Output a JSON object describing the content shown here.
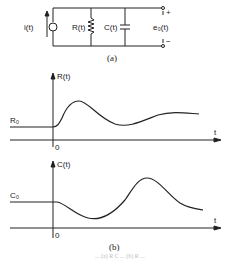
{
  "circuit": {
    "source_label": "i(t)",
    "resistor_label": "R(t)",
    "capacitor_label": "C(t)",
    "output_label": "e₀(t)",
    "plus": "+",
    "minus": "−",
    "caption": "(a)"
  },
  "plots": {
    "top": {
      "y_label": "R(t)",
      "x_label": "t",
      "origin": "0",
      "initial_level": "R₀"
    },
    "bottom": {
      "y_label": "C(t)",
      "x_label": "t",
      "origin": "0",
      "initial_level": "C₀"
    },
    "caption": "(b)"
  },
  "footer": {
    "faint_text": "... (a) R C ... (b) R ..."
  }
}
